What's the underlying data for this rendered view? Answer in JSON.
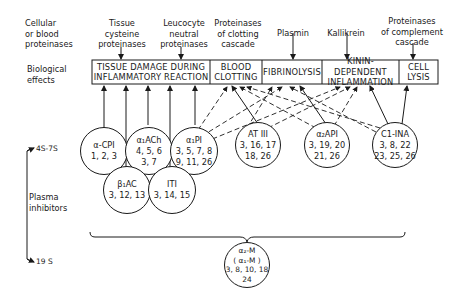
{
  "left_labels": {
    "cellular": [
      "Cellular",
      "or blood",
      "proteinases"
    ],
    "biological_effects": [
      "Biological",
      "effects"
    ],
    "size_top": "4S-7S",
    "plasma_inhibitors": [
      "Plasma",
      "inhibitors"
    ],
    "size_bottom": "19 S"
  },
  "proteinases": [
    {
      "id": "tissue",
      "lines": [
        "Tissue",
        "cysteine",
        "proteinases"
      ]
    },
    {
      "id": "leucocyte",
      "lines": [
        "Leucocyte",
        "neutral",
        "proteinases"
      ]
    },
    {
      "id": "clotting",
      "lines": [
        "Proteinases",
        "of clotting",
        "cascade"
      ]
    },
    {
      "id": "plasmin",
      "lines": [
        "Plasmin"
      ]
    },
    {
      "id": "kallikrein",
      "lines": [
        "Kallikrein"
      ]
    },
    {
      "id": "complement",
      "lines": [
        "Proteinases",
        "of complement",
        "cascade"
      ]
    }
  ],
  "effects": [
    {
      "id": "tissue-damage",
      "lines": [
        "TISSUE  DAMAGE  DURING",
        "INFLAMMATORY REACTION"
      ]
    },
    {
      "id": "blood-clotting",
      "lines": [
        "BLOOD",
        "CLOTTING"
      ]
    },
    {
      "id": "fibrinolysis",
      "lines": [
        "FIBRINOLYSIS"
      ]
    },
    {
      "id": "kinin",
      "lines": [
        "KININ-DEPENDENT",
        "INFLAMMATION"
      ]
    },
    {
      "id": "cell-lysis",
      "lines": [
        "CELL",
        "LYSIS"
      ]
    }
  ],
  "inhibitors": [
    {
      "id": "alpha-cpi",
      "name": "α-CPI",
      "refs": [
        "1, 2, 3"
      ]
    },
    {
      "id": "alpha1-ach",
      "name": "α₁ACh",
      "refs": [
        "4, 5, 6",
        "3, 7"
      ]
    },
    {
      "id": "alpha1-pi",
      "name": "α₁PI",
      "refs": [
        "3, 5, 7, 8",
        "9, 11, 26"
      ]
    },
    {
      "id": "beta1-ac",
      "name": "β₁AC",
      "refs": [
        "3, 12, 13"
      ]
    },
    {
      "id": "iti",
      "name": "ITI",
      "refs": [
        "3, 14, 15"
      ]
    },
    {
      "id": "at-iii",
      "name": "AT III",
      "refs": [
        "3, 16, 17",
        "18, 26"
      ]
    },
    {
      "id": "alpha2-api",
      "name": "α₂API",
      "refs": [
        "3, 19, 20",
        "21, 26"
      ]
    },
    {
      "id": "c1-ina",
      "name": "C1-INA",
      "refs": [
        "3, 8, 22",
        "23, 25, 26"
      ]
    },
    {
      "id": "alpha2-m",
      "name": "α₂-M",
      "alt": "( α₁-M )",
      "refs": [
        "3, 8, 10, 18",
        "24"
      ]
    }
  ],
  "connections": {
    "solid": [
      [
        "alpha-cpi",
        "tissue-damage"
      ],
      [
        "alpha1-ach",
        "tissue-damage"
      ],
      [
        "alpha1-pi",
        "tissue-damage"
      ],
      [
        "beta1-ac",
        "tissue-damage"
      ],
      [
        "iti",
        "tissue-damage"
      ],
      [
        "at-iii",
        "blood-clotting"
      ],
      [
        "alpha2-api",
        "fibrinolysis"
      ],
      [
        "c1-ina",
        "kinin"
      ],
      [
        "c1-ina",
        "cell-lysis"
      ]
    ],
    "dashed": [
      [
        "alpha1-pi",
        "blood-clotting"
      ],
      [
        "alpha1-pi",
        "fibrinolysis"
      ],
      [
        "alpha1-pi",
        "kinin"
      ],
      [
        "at-iii",
        "fibrinolysis"
      ],
      [
        "at-iii",
        "kinin"
      ],
      [
        "alpha2-api",
        "blood-clotting"
      ],
      [
        "alpha2-api",
        "kinin"
      ],
      [
        "c1-ina",
        "blood-clotting"
      ],
      [
        "c1-ina",
        "fibrinolysis"
      ]
    ]
  }
}
